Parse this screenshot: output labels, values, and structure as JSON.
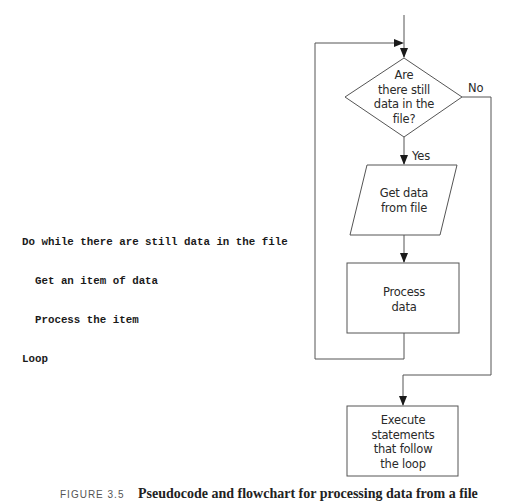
{
  "pseudocode": {
    "lines": [
      "Do while there are still data in the file",
      "  Get an item of data",
      "  Process the item",
      "Loop"
    ]
  },
  "flowchart": {
    "decision": {
      "lines": [
        "Are",
        "there still",
        "data in the",
        "file?"
      ]
    },
    "yes_label": "Yes",
    "no_label": "No",
    "input_step": {
      "lines": [
        "Get data",
        "from file"
      ]
    },
    "process_step": {
      "lines": [
        "Process",
        "data"
      ]
    },
    "exit_step": {
      "lines": [
        "Execute",
        "statements",
        "that follow",
        "the loop"
      ]
    },
    "colors": {
      "stroke": "#555555",
      "text": "#2a2a2a"
    }
  },
  "caption": {
    "figure_label": "FIGURE 3.5",
    "text": "Pseudocode and flowchart for processing data from a file"
  }
}
